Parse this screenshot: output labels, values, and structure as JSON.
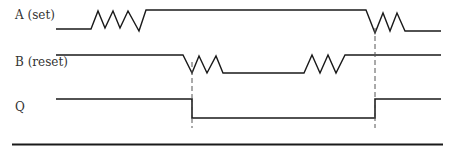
{
  "diagram": {
    "type": "timing-diagram",
    "signals": [
      {
        "id": "A",
        "label": "A (set)"
      },
      {
        "id": "B",
        "label": "B (reset)"
      },
      {
        "id": "Q",
        "label": "Q"
      }
    ],
    "colors": {
      "line": "#1a1a1a",
      "dash": "#555555",
      "text": "#333333"
    }
  }
}
